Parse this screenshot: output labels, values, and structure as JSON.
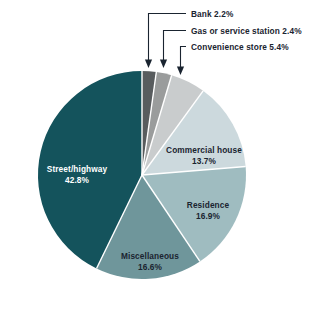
{
  "chart_data": {
    "type": "pie",
    "title": "",
    "subtitle": "",
    "xlabel": "",
    "ylabel": "",
    "legend_position": "none",
    "grid": false,
    "units": "percent",
    "start_angle_deg": 0,
    "direction": "clockwise",
    "total": 100.0,
    "categories": [
      "Bank",
      "Gas or service station",
      "Convenience store",
      "Commercial house",
      "Residence",
      "Miscellaneous",
      "Street/highway"
    ],
    "values": [
      2.2,
      2.4,
      5.4,
      13.7,
      16.9,
      16.6,
      42.8
    ],
    "slices": [
      {
        "name": "Bank",
        "label": "Bank 2.2%",
        "value": 2.2,
        "value_text": "2.2%",
        "color": "#585c5e",
        "label_style": "callout",
        "label_text_color": "#1a2430"
      },
      {
        "name": "Gas or service station",
        "label": "Gas or service station 2.4%",
        "value": 2.4,
        "value_text": "2.4%",
        "color": "#9a9c9c",
        "label_style": "callout",
        "label_text_color": "#1a2430"
      },
      {
        "name": "Convenience store",
        "label": "Convenience store 5.4%",
        "value": 5.4,
        "value_text": "5.4%",
        "color": "#c9cccd",
        "label_style": "callout",
        "label_text_color": "#1a2430"
      },
      {
        "name": "Commercial house",
        "label": "Commercial house",
        "value": 13.7,
        "value_text": "13.7%",
        "color": "#ccd9dd",
        "label_style": "inside",
        "label_text_color": "#1a2430"
      },
      {
        "name": "Residence",
        "label": "Residence",
        "value": 16.9,
        "value_text": "16.9%",
        "color": "#9fbcc0",
        "label_style": "inside",
        "label_text_color": "#1a2430"
      },
      {
        "name": "Miscellaneous",
        "label": "Miscellaneous",
        "value": 16.6,
        "value_text": "16.6%",
        "color": "#6f969b",
        "label_style": "inside",
        "label_text_color": "#1a2430"
      },
      {
        "name": "Street/highway",
        "label": "Street/highway",
        "value": 42.8,
        "value_text": "42.8%",
        "color": "#14535c",
        "label_style": "inside",
        "label_text_color": "#ffffff"
      }
    ],
    "callouts": [
      {
        "name": "Bank",
        "text": "Bank 2.2%"
      },
      {
        "name": "Gas or service station",
        "text": "Gas or service station 2.4%"
      },
      {
        "name": "Convenience store",
        "text": "Convenience store 5.4%"
      }
    ],
    "colors": {
      "background": "#ffffff",
      "separator": "#ffffff",
      "text": "#1a2430",
      "leader_line": "#1a2430"
    }
  }
}
